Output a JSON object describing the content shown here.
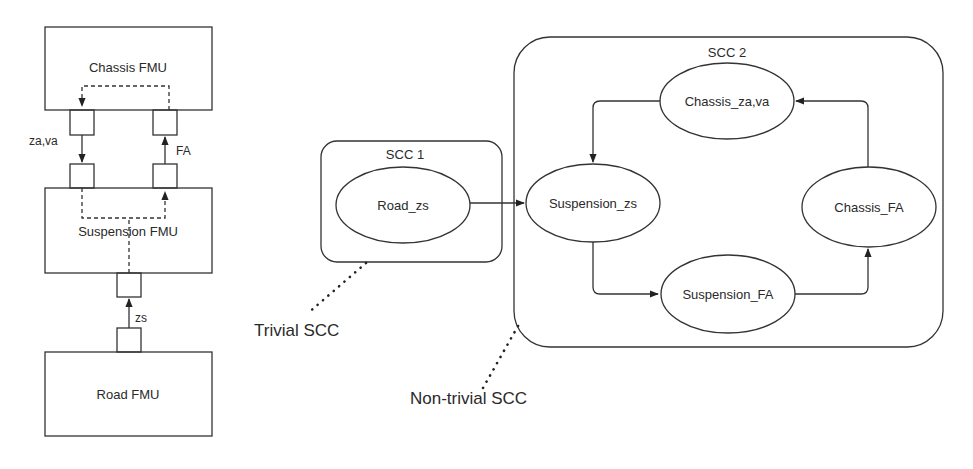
{
  "left_diagram": {
    "chassis_fmu": "Chassis FMU",
    "suspension_fmu": "Suspension FMU",
    "road_fmu": "Road FMU",
    "signal_za_va": "za,va",
    "signal_fa": "FA",
    "signal_zs": "zs"
  },
  "right_diagram": {
    "scc1": {
      "label": "SCC 1",
      "nodes": [
        "Road_zs"
      ]
    },
    "scc2": {
      "label": "SCC 2",
      "nodes": [
        "Chassis_za,va",
        "Suspension_zs",
        "Chassis_FA",
        "Suspension_FA"
      ]
    },
    "edges": [
      {
        "from": "Road_zs",
        "to": "Suspension_zs"
      },
      {
        "from": "Chassis_za,va",
        "to": "Suspension_zs"
      },
      {
        "from": "Suspension_zs",
        "to": "Suspension_FA"
      },
      {
        "from": "Suspension_FA",
        "to": "Chassis_FA"
      },
      {
        "from": "Chassis_FA",
        "to": "Chassis_za,va"
      }
    ],
    "annotations": {
      "trivial": "Trivial SCC",
      "non_trivial": "Non-trivial SCC"
    }
  }
}
